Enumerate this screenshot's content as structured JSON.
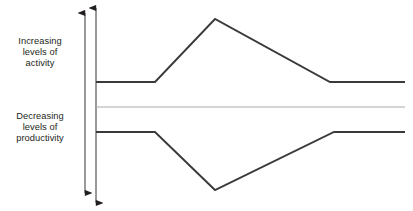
{
  "figure": {
    "background_color": "#ffffff",
    "line_color": "#3a3a3c",
    "midline_color": "#a7a9ac",
    "text_color": "#231f20",
    "width": 413,
    "height": 211
  },
  "labels": {
    "activity": {
      "name": "increasing-levels-of-activity",
      "line1": "Increasing",
      "line2": "levels of",
      "line3": "activity"
    },
    "productivity": {
      "name": "decreasing-levels-of-productivity",
      "line1": "Decreasing",
      "line2": "levels of",
      "line3": "productivity"
    }
  },
  "axes": {
    "outer_arrow": {
      "name": "outer-vertical-double-arrow",
      "x": 85,
      "y_top": 13,
      "y_bottom": 193
    },
    "inner_arrow": {
      "name": "inner-vertical-double-arrow",
      "x": 96,
      "y_top": 8,
      "y_bottom": 203
    }
  },
  "chart_data": {
    "type": "line",
    "title": "",
    "subtitle": "",
    "xlabel": "",
    "ylabel": "",
    "grid": false,
    "legend_position": "left",
    "axis_ranges": {
      "x": [
        96,
        405
      ],
      "y": [
        8,
        203
      ]
    },
    "annotations": [
      "Increasing levels of activity",
      "Decreasing levels of productivity"
    ],
    "series": [
      {
        "name": "Increasing levels of activity",
        "color": "#3a3a3c",
        "stroke_width": 1.9,
        "points": [
          {
            "x": 96,
            "y": 82
          },
          {
            "x": 155,
            "y": 82
          },
          {
            "x": 215,
            "y": 19
          },
          {
            "x": 330,
            "y": 82
          },
          {
            "x": 405,
            "y": 82
          }
        ]
      },
      {
        "name": "Baseline",
        "color": "#a7a9ac",
        "stroke_width": 1.2,
        "points": [
          {
            "x": 96,
            "y": 107
          },
          {
            "x": 405,
            "y": 107
          }
        ]
      },
      {
        "name": "Decreasing levels of productivity",
        "color": "#3a3a3c",
        "stroke_width": 1.9,
        "points": [
          {
            "x": 96,
            "y": 132
          },
          {
            "x": 155,
            "y": 132
          },
          {
            "x": 215,
            "y": 190
          },
          {
            "x": 334,
            "y": 132
          },
          {
            "x": 405,
            "y": 132
          }
        ]
      }
    ]
  }
}
